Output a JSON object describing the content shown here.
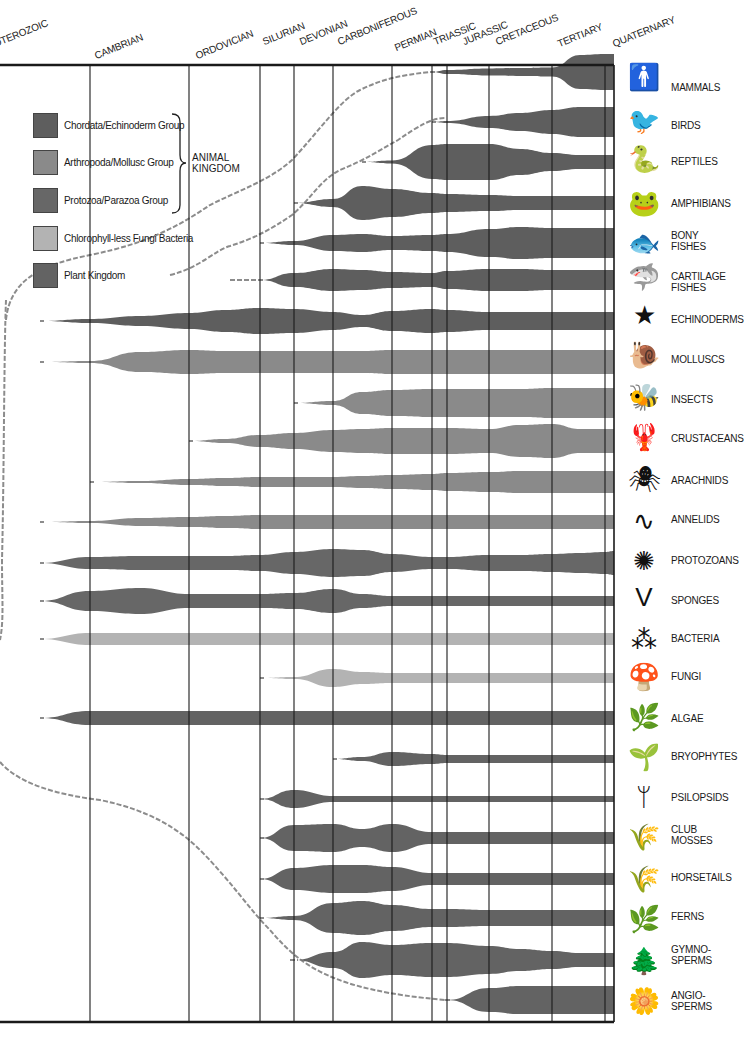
{
  "chart_data": {
    "type": "area",
    "title": "",
    "subtitle": "Evolutionary tree of life through geological periods",
    "xlabel": "Geological period",
    "ylabel": "",
    "grid": true,
    "legend_position": "top-left inside plot",
    "periods": [
      "PROTEROZOIC",
      "CAMBRIAN",
      "ORDOVICIAN",
      "SILURIAN",
      "DEVONIAN",
      "CARBONIFEROUS",
      "PERMIAN",
      "TRIASSIC",
      "JURASSIC",
      "CRETACEOUS",
      "TERTIARY",
      "QUATERNARY"
    ],
    "period_label_visible": [
      "OTEROZOIC",
      "CAMBRIAN",
      "ORDOVICIAN",
      "SILURIAN",
      "DEVONIAN",
      "CARBONIFEROUS",
      "PERMIAN",
      "TRIASSIC",
      "JURASSIC",
      "CRETACEOUS",
      "TERTIARY",
      "QUATERNARY"
    ],
    "boundaries_x": [
      0,
      90,
      189,
      260,
      294,
      333,
      392,
      432,
      447,
      489,
      552,
      605,
      614
    ],
    "sample_x": [
      0,
      40,
      90,
      140,
      189,
      225,
      260,
      294,
      333,
      362,
      392,
      432,
      447,
      489,
      520,
      552,
      580,
      605,
      614
    ],
    "legend": [
      {
        "label": "Chordata/Echinoderm Group",
        "color": "#5e5e5e"
      },
      {
        "label": "Arthropoda/Mollusc Group",
        "color": "#8a8a8a"
      },
      {
        "label": "Protozoa/Parazoa Group",
        "color": "#676767"
      },
      {
        "label": "Chlorophyll-less Fungi Bacteria",
        "color": "#b3b3b3"
      },
      {
        "label": "Plant Kingdom",
        "color": "#636363"
      }
    ],
    "brace_label": "ANIMAL\nKINGDOM",
    "series": [
      {
        "name": "MAMMALS",
        "group": 0,
        "y": 72,
        "origin_x": 430,
        "widths": [
          0,
          0,
          0,
          0,
          0,
          0,
          0,
          0,
          0,
          0,
          0,
          0,
          4,
          7,
          8,
          9,
          34,
          36,
          36
        ]
      },
      {
        "name": "BIRDS",
        "group": 0,
        "y": 122,
        "origin_x": 445,
        "widths": [
          0,
          0,
          0,
          0,
          0,
          0,
          0,
          0,
          0,
          0,
          0,
          0,
          2,
          12,
          18,
          24,
          30,
          30,
          30
        ]
      },
      {
        "name": "REPTILES",
        "group": 0,
        "y": 162,
        "origin_x": 398,
        "widths": [
          0,
          0,
          0,
          0,
          0,
          0,
          0,
          0,
          0,
          0,
          3,
          34,
          36,
          36,
          26,
          18,
          14,
          14,
          14
        ]
      },
      {
        "name": "AMPHIBIANS",
        "group": 0,
        "y": 203,
        "origin_x": 328,
        "widths": [
          0,
          0,
          0,
          0,
          0,
          0,
          0,
          0,
          8,
          34,
          28,
          20,
          18,
          16,
          14,
          14,
          14,
          14,
          14
        ]
      },
      {
        "name": "BONY FISHES",
        "group": 0,
        "y": 243,
        "origin_x": 292,
        "widths": [
          0,
          0,
          0,
          0,
          0,
          0,
          0,
          4,
          16,
          18,
          14,
          16,
          18,
          28,
          32,
          30,
          30,
          30,
          30
        ]
      },
      {
        "name": "CARTILAGE FISHES",
        "group": 0,
        "y": 280,
        "origin_x": 230,
        "widths": [
          0,
          0,
          0,
          0,
          0,
          0,
          0,
          14,
          22,
          20,
          16,
          14,
          18,
          22,
          22,
          20,
          20,
          20,
          20
        ]
      },
      {
        "name": "ECHINODERMS",
        "group": 0,
        "y": 321,
        "origin_x": 50,
        "widths": [
          0,
          0,
          4,
          10,
          16,
          22,
          26,
          24,
          18,
          12,
          20,
          24,
          22,
          18,
          18,
          18,
          18,
          18,
          18
        ]
      },
      {
        "name": "MOLLUSCS",
        "group": 1,
        "y": 362,
        "origin_x": 92,
        "widths": [
          0,
          0,
          2,
          20,
          24,
          22,
          22,
          22,
          22,
          22,
          24,
          24,
          24,
          24,
          24,
          24,
          24,
          24,
          24
        ]
      },
      {
        "name": "INSECTS",
        "group": 1,
        "y": 403,
        "origin_x": 300,
        "widths": [
          0,
          0,
          0,
          0,
          0,
          0,
          0,
          0,
          4,
          22,
          26,
          28,
          28,
          28,
          28,
          30,
          30,
          30,
          30
        ]
      },
      {
        "name": "CRUSTACEANS",
        "group": 1,
        "y": 441,
        "origin_x": 212,
        "widths": [
          0,
          0,
          0,
          0,
          0,
          4,
          12,
          16,
          22,
          24,
          26,
          26,
          26,
          24,
          32,
          34,
          24,
          24,
          24
        ]
      },
      {
        "name": "ARACHNIDS",
        "group": 1,
        "y": 482,
        "origin_x": 120,
        "widths": [
          0,
          0,
          0,
          2,
          6,
          8,
          10,
          10,
          10,
          12,
          14,
          16,
          18,
          20,
          22,
          22,
          22,
          22,
          22
        ]
      },
      {
        "name": "ANNELIDS",
        "group": 1,
        "y": 522,
        "origin_x": 90,
        "widths": [
          0,
          0,
          2,
          8,
          10,
          12,
          14,
          14,
          14,
          14,
          14,
          14,
          14,
          14,
          14,
          14,
          14,
          14,
          14
        ]
      },
      {
        "name": "PROTOZOANS",
        "group": 2,
        "y": 563,
        "origin_x": 88,
        "widths": [
          0,
          0,
          12,
          14,
          14,
          14,
          16,
          22,
          28,
          26,
          18,
          12,
          12,
          16,
          16,
          18,
          20,
          22,
          24
        ]
      },
      {
        "name": "SPONGES",
        "group": 2,
        "y": 601,
        "origin_x": 60,
        "widths": [
          0,
          0,
          20,
          26,
          14,
          14,
          14,
          16,
          24,
          14,
          10,
          10,
          10,
          10,
          10,
          10,
          10,
          10,
          10
        ]
      },
      {
        "name": "BACTERIA",
        "group": 3,
        "y": 639,
        "origin_x": 40,
        "widths": [
          0,
          0,
          12,
          12,
          12,
          12,
          12,
          12,
          12,
          12,
          12,
          12,
          12,
          12,
          12,
          12,
          12,
          12,
          12
        ]
      },
      {
        "name": "FUNGI",
        "group": 3,
        "y": 678,
        "origin_x": 296,
        "widths": [
          0,
          0,
          0,
          0,
          0,
          0,
          0,
          2,
          18,
          12,
          10,
          10,
          10,
          10,
          10,
          10,
          10,
          10,
          10
        ]
      },
      {
        "name": "ALGAE",
        "group": 4,
        "y": 718,
        "origin_x": 40,
        "widths": [
          0,
          0,
          14,
          14,
          14,
          14,
          14,
          14,
          14,
          14,
          14,
          14,
          14,
          14,
          14,
          14,
          14,
          14,
          14
        ]
      },
      {
        "name": "BRYOPHYTES",
        "group": 4,
        "y": 759,
        "origin_x": 350,
        "widths": [
          0,
          0,
          0,
          0,
          0,
          0,
          0,
          0,
          0,
          4,
          14,
          10,
          8,
          8,
          8,
          8,
          8,
          8,
          8
        ]
      },
      {
        "name": "PSILOPSIDS",
        "group": 4,
        "y": 799,
        "origin_x": 268,
        "widths": [
          0,
          0,
          0,
          0,
          0,
          0,
          0,
          18,
          6,
          6,
          6,
          6,
          6,
          6,
          6,
          6,
          6,
          6,
          6
        ]
      },
      {
        "name": "CLUB MOSSES",
        "group": 4,
        "y": 838,
        "origin_x": 268,
        "widths": [
          0,
          0,
          0,
          0,
          0,
          0,
          0,
          26,
          28,
          18,
          28,
          12,
          12,
          12,
          12,
          12,
          12,
          12,
          12
        ]
      },
      {
        "name": "HORSETAILS",
        "group": 4,
        "y": 879,
        "origin_x": 270,
        "widths": [
          0,
          0,
          0,
          0,
          0,
          0,
          0,
          22,
          28,
          28,
          24,
          12,
          12,
          12,
          12,
          12,
          12,
          12,
          12
        ]
      },
      {
        "name": "FERNS",
        "group": 4,
        "y": 918,
        "origin_x": 270,
        "widths": [
          0,
          0,
          0,
          0,
          0,
          0,
          0,
          4,
          30,
          34,
          26,
          18,
          18,
          16,
          16,
          16,
          16,
          16,
          16
        ]
      },
      {
        "name": "GYMNOSPERMS",
        "group": 4,
        "y": 960,
        "origin_x": 290,
        "widths": [
          0,
          0,
          0,
          0,
          0,
          0,
          0,
          0,
          16,
          36,
          30,
          34,
          34,
          28,
          22,
          18,
          14,
          14,
          14
        ]
      },
      {
        "name": "ANGIOSPERMS",
        "group": 4,
        "y": 1000,
        "origin_x": 445,
        "widths": [
          0,
          0,
          0,
          0,
          0,
          0,
          0,
          0,
          0,
          0,
          0,
          0,
          0,
          24,
          28,
          28,
          28,
          28,
          28
        ]
      }
    ]
  },
  "row_labels": [
    {
      "text": "MAMMALS",
      "y": 82
    },
    {
      "text": "BIRDS",
      "y": 120
    },
    {
      "text": "REPTILES",
      "y": 156
    },
    {
      "text": "AMPHIBIANS",
      "y": 198
    },
    {
      "text": "BONY\nFISHES",
      "y": 230
    },
    {
      "text": "CARTILAGE\nFISHES",
      "y": 271
    },
    {
      "text": "ECHINODERMS",
      "y": 314
    },
    {
      "text": "MOLLUSCS",
      "y": 354
    },
    {
      "text": "INSECTS",
      "y": 394
    },
    {
      "text": "CRUSTACEANS",
      "y": 433
    },
    {
      "text": "ARACHNIDS",
      "y": 475
    },
    {
      "text": "ANNELIDS",
      "y": 514
    },
    {
      "text": "PROTOZOANS",
      "y": 555
    },
    {
      "text": "SPONGES",
      "y": 595
    },
    {
      "text": "BACTERIA",
      "y": 633
    },
    {
      "text": "FUNGI",
      "y": 671
    },
    {
      "text": "ALGAE",
      "y": 713
    },
    {
      "text": "BRYOPHYTES",
      "y": 751
    },
    {
      "text": "PSILOPSIDS",
      "y": 792
    },
    {
      "text": "CLUB\nMOSSES",
      "y": 824
    },
    {
      "text": "HORSETAILS",
      "y": 872
    },
    {
      "text": "FERNS",
      "y": 911
    },
    {
      "text": "GYMNO-\nSPERMS",
      "y": 944
    },
    {
      "text": "ANGIO-\nSPERMS",
      "y": 990
    }
  ],
  "icons": [
    {
      "name": "human-silhouette-icon",
      "glyph": "🚹",
      "y": 62
    },
    {
      "name": "bird-icon",
      "glyph": "🐦",
      "y": 106
    },
    {
      "name": "snake-icon",
      "glyph": "🐍",
      "y": 144
    },
    {
      "name": "frog-icon",
      "glyph": "🐸",
      "y": 188
    },
    {
      "name": "fish-icon",
      "glyph": "🐟",
      "y": 228
    },
    {
      "name": "shark-icon",
      "glyph": "🦈",
      "y": 262
    },
    {
      "name": "starfish-icon",
      "glyph": "★",
      "y": 300
    },
    {
      "name": "snail-icon",
      "glyph": "🐌",
      "y": 340
    },
    {
      "name": "bee-icon",
      "glyph": "🐝",
      "y": 382
    },
    {
      "name": "lobster-icon",
      "glyph": "🦞",
      "y": 422
    },
    {
      "name": "spider-icon",
      "glyph": "🕷",
      "y": 464
    },
    {
      "name": "worm-icon",
      "glyph": "∿",
      "y": 506
    },
    {
      "name": "amoeba-icon",
      "glyph": "✺",
      "y": 546
    },
    {
      "name": "sponge-icon",
      "glyph": "V",
      "y": 582
    },
    {
      "name": "bacteria-icon",
      "glyph": "⁂",
      "y": 624
    },
    {
      "name": "mushroom-icon",
      "glyph": "🍄",
      "y": 662
    },
    {
      "name": "seaweed-icon",
      "glyph": "🌿",
      "y": 702
    },
    {
      "name": "moss-icon",
      "glyph": "🌱",
      "y": 742
    },
    {
      "name": "psilopsid-icon",
      "glyph": "ᛘ",
      "y": 782
    },
    {
      "name": "club-moss-icon",
      "glyph": "🌾",
      "y": 822
    },
    {
      "name": "horsetail-icon",
      "glyph": "🌾",
      "y": 864
    },
    {
      "name": "fern-icon",
      "glyph": "🌿",
      "y": 904
    },
    {
      "name": "pinecone-icon",
      "glyph": "🌲",
      "y": 946
    },
    {
      "name": "flower-icon",
      "glyph": "🌼",
      "y": 986
    }
  ],
  "colors": {
    "axis": "#1a1a1a",
    "gridline": "#1a1a1a",
    "dash": "#8c8c8c",
    "groups": [
      "#5e5e5e",
      "#8a8a8a",
      "#676767",
      "#b3b3b3",
      "#636363"
    ]
  }
}
